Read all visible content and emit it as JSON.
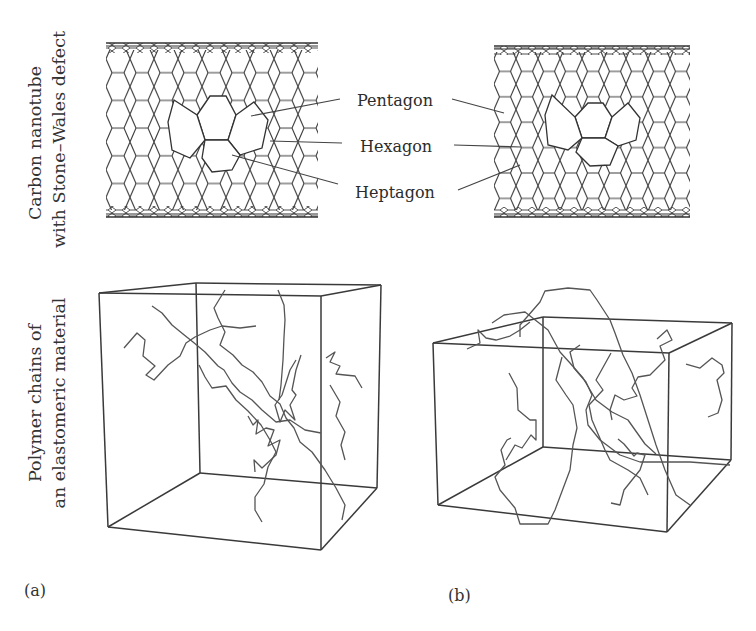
{
  "figure": {
    "rows": [
      {
        "row_label_line1": "Carbon nanotube",
        "row_label_line2": "with Stone–Wales defect"
      },
      {
        "row_label_line1": "Polymer chains of",
        "row_label_line2": "an elastomeric material"
      }
    ],
    "defect_labels": {
      "pentagon": "Pentagon",
      "hexagon": "Hexagon",
      "heptagon": "Heptagon"
    },
    "panels": [
      {
        "id": "a",
        "label": "(a)"
      },
      {
        "id": "b",
        "label": "(b)"
      }
    ],
    "colors": {
      "line": "#3a3a3a",
      "chain": "#555555",
      "background": "#ffffff"
    }
  }
}
